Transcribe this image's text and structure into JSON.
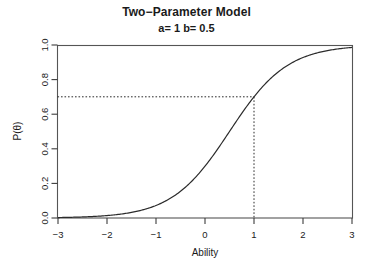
{
  "chart_data": {
    "type": "line",
    "title": "Two−Parameter Model",
    "subtitle": "a= 1 b= 0.5",
    "xlabel": "Ability",
    "ylabel": "P(θ)",
    "xlim": [
      -3,
      3
    ],
    "ylim": [
      0.0,
      1.0
    ],
    "xticks": [
      -3,
      -2,
      -1,
      0,
      1,
      2,
      3
    ],
    "xtick_labels": [
      "−3",
      "−2",
      "−1",
      "0",
      "1",
      "2",
      "3"
    ],
    "yticks": [
      0.0,
      0.2,
      0.4,
      0.6,
      0.8,
      1.0
    ],
    "ytick_labels": [
      "0.0",
      "0.2",
      "0.4",
      "0.6",
      "0.8",
      "1.0"
    ],
    "grid": false,
    "legend": false,
    "model": {
      "name": "2PL logistic item characteristic curve",
      "formula": "P(theta) = 1 / (1 + exp(-1.7 * a * (theta - b)))",
      "a": 1,
      "b": 0.5,
      "D": 1.7
    },
    "curve_color": "#2b2b2b",
    "reference_lines": {
      "style": "dotted",
      "color": "#2b2b2b",
      "vertical_x": 1,
      "horizontal_y": 0.62
    },
    "x": [
      -3.0,
      -2.8,
      -2.6,
      -2.4,
      -2.2,
      -2.0,
      -1.8,
      -1.6,
      -1.4,
      -1.2,
      -1.0,
      -0.8,
      -0.6,
      -0.4,
      -0.2,
      0.0,
      0.2,
      0.4,
      0.6,
      0.8,
      1.0,
      1.2,
      1.4,
      1.6,
      1.8,
      2.0,
      2.2,
      2.4,
      2.6,
      2.8,
      3.0
    ],
    "values": [
      0.042,
      0.058,
      0.079,
      0.108,
      0.145,
      0.193,
      0.252,
      0.323,
      0.403,
      0.488,
      0.574,
      0.655,
      0.728,
      0.79,
      0.841,
      0.88,
      0.911,
      0.934,
      0.951,
      0.964,
      0.973,
      0.98,
      0.985,
      0.989,
      0.992,
      0.994,
      0.995,
      0.997,
      0.997,
      0.998,
      0.999
    ],
    "note": "Rendered curve uses D=1.7 scaling; point at theta=1 has P≈0.62 marked by dotted reference lines."
  },
  "axis_titles": {
    "x": "Ability",
    "y": "P(θ)"
  }
}
